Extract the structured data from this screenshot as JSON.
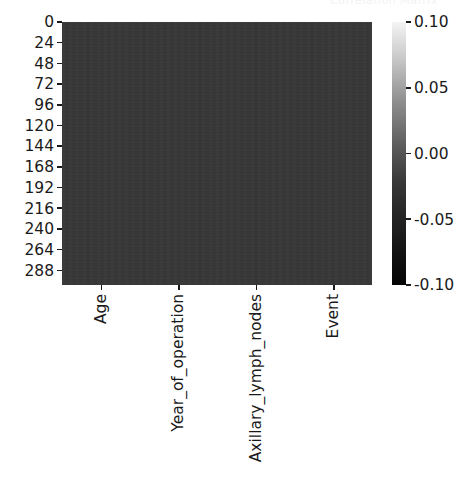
{
  "figure": {
    "background_color": "#ffffff",
    "title_remnant": "Correlation Matrix"
  },
  "chart_data": {
    "type": "heatmap",
    "title": "",
    "xlabel": "",
    "ylabel": "",
    "grid": false,
    "colormap": "gray",
    "columns": [
      "Age",
      "Year_of_operation",
      "Axillary_lymph_nodes",
      "Event"
    ],
    "x_tick_labels": [
      "Age",
      "Year_of_operation",
      "Axillary_lymph_nodes",
      "Event"
    ],
    "y_tick_labels": [
      "0",
      "24",
      "48",
      "72",
      "96",
      "120",
      "144",
      "168",
      "192",
      "216",
      "240",
      "264",
      "288"
    ],
    "y_tick_values": [
      0,
      24,
      48,
      72,
      96,
      120,
      144,
      168,
      192,
      216,
      240,
      264,
      288
    ],
    "ylim": [
      305,
      0
    ],
    "n_rows": 306,
    "n_cols": 4,
    "cell_fill_color": "#383838",
    "approx_cell_value": 0.0,
    "colorbar": {
      "vmin": -0.1,
      "vmax": 0.1,
      "tick_labels": [
        "0.10",
        "0.05",
        "0.00",
        "-0.05",
        "-0.10"
      ],
      "tick_values": [
        0.1,
        0.05,
        0.0,
        -0.05,
        -0.1
      ],
      "low_color": "#000000",
      "high_color": "#ffffff"
    }
  }
}
